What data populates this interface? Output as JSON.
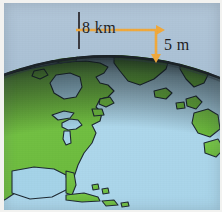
{
  "figure": {
    "name": "earth-curvature-diagram",
    "width": 222,
    "height": 212
  },
  "annotations": {
    "distance_label": "8 km",
    "drop_label": "5 m",
    "tick_name": "vertical-reference-tick",
    "horizontal_arrow_name": "horizontal-distance-arrow",
    "vertical_arrow_name": "vertical-drop-arrow"
  },
  "geography": {
    "landmasses": [
      "North America",
      "Greenland",
      "Iceland",
      "Northern Europe",
      "Caribbean islands"
    ],
    "waterbodies": [
      "Atlantic Ocean",
      "Gulf of Mexico",
      "Hudson Bay",
      "Great Lakes"
    ]
  },
  "colors": {
    "sky": "#a8c0d4",
    "ocean": "#a5d3e8",
    "land": "#72c042",
    "coastline": "#1e2a33",
    "globe_rim": "#20282e",
    "arrow": "#f0a93c",
    "tick": "#3b3b42",
    "text": "#1d1d22",
    "frame": "#f2f2f0"
  }
}
